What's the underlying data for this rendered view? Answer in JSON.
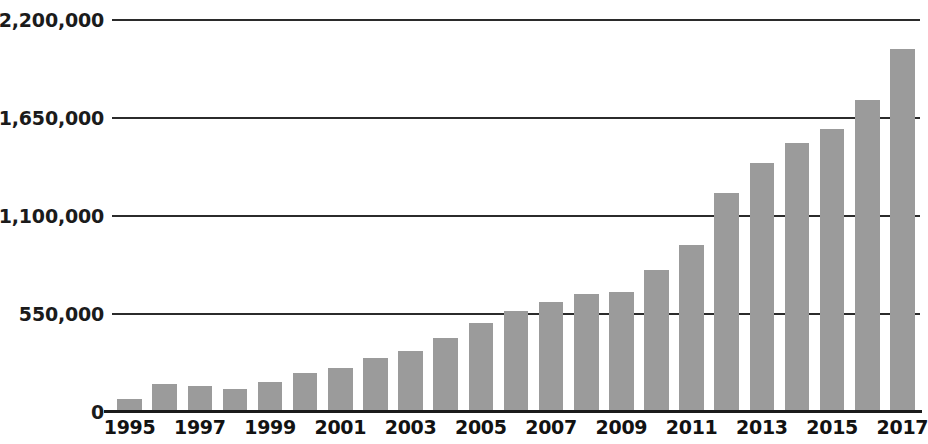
{
  "chart_data": {
    "type": "bar",
    "title": "",
    "subtitle": "",
    "xlabel": "",
    "ylabel": "",
    "grid": true,
    "legend": null,
    "legend_position": "none",
    "bar_color": "#9b9b9b",
    "axis_color": "#1b1b1b",
    "ylim": [
      0,
      2200000
    ],
    "ytick_values": [
      0,
      550000,
      1100000,
      1650000,
      2200000
    ],
    "ytick_labels": [
      "0",
      "550,000",
      "1,100,000",
      "1,650,000",
      "2,200,000"
    ],
    "categories": [
      "1995",
      "1996",
      "1997",
      "1998",
      "1999",
      "2000",
      "2001",
      "2002",
      "2003",
      "2004",
      "2005",
      "2006",
      "2007",
      "2008",
      "2009",
      "2010",
      "2011",
      "2012",
      "2013",
      "2014",
      "2015",
      "2016",
      "2017"
    ],
    "xtick_labels": [
      "1995",
      "1997",
      "1999",
      "2001",
      "2003",
      "2005",
      "2007",
      "2009",
      "2011",
      "2013",
      "2015",
      "2017"
    ],
    "values": [
      75000,
      160000,
      148000,
      130000,
      168000,
      218000,
      245000,
      305000,
      340000,
      418000,
      500000,
      565000,
      620000,
      660000,
      672000,
      795000,
      940000,
      1230000,
      1400000,
      1510000,
      1590000,
      1750000,
      2040000
    ]
  }
}
